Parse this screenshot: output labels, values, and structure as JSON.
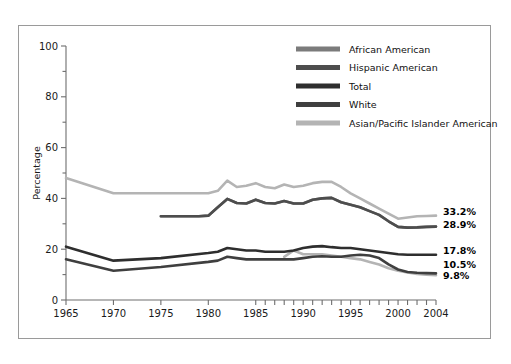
{
  "chart_data": {
    "type": "line",
    "title": "",
    "xlabel": "",
    "ylabel": "Percentage",
    "xlim": [
      1965,
      2004
    ],
    "ylim": [
      0,
      100
    ],
    "grid": false,
    "legend_position": "top-center-right",
    "y_ticks_major": [
      0,
      20,
      40,
      60,
      80,
      100
    ],
    "y_ticks_minor": [
      10,
      30,
      50,
      70,
      90
    ],
    "x_ticks_labeled": [
      1965,
      1970,
      1975,
      1980,
      1985,
      1990,
      1995,
      2000,
      2004
    ],
    "x_ticks_annual_from": 1985,
    "x_ticks_annual_to": 2004,
    "colors": {
      "african_american": "#7b7b7b",
      "hispanic_american": "#4d4d4d",
      "total": "#2e2e2e",
      "white": "#3f3f3f",
      "asian_pacific": "#b4b4b4"
    },
    "series": [
      {
        "name": "African American",
        "color_key": "african_american",
        "end_label": "33.2%",
        "x": [
          1975,
          1976,
          1977,
          1978,
          1979,
          1980,
          1981,
          1982,
          1983,
          1984,
          1985,
          1986,
          1987,
          1988,
          1989,
          1990,
          1991,
          1992,
          1993,
          1994,
          1995,
          1996,
          1997,
          1998,
          1999,
          2000,
          2001,
          2002,
          2003,
          2004
        ],
        "y": [
          33.0,
          33.0,
          33.0,
          33.0,
          33.0,
          33.2,
          36.5,
          39.8,
          38.2,
          38.0,
          39.5,
          38.2,
          38.0,
          39.0,
          38.0,
          38.0,
          39.5,
          40.0,
          40.2,
          38.5,
          37.5,
          36.5,
          35.0,
          33.5,
          31.0,
          28.8,
          28.5,
          28.6,
          28.8,
          28.9
        ]
      },
      {
        "name": "Hispanic American",
        "color_key": "hispanic_american",
        "end_label": "28.9%",
        "x": [
          1975,
          1976,
          1977,
          1978,
          1979,
          1980,
          1981,
          1982,
          1983,
          1984,
          1985,
          1986,
          1987,
          1988,
          1989,
          1990,
          1991,
          1992,
          1993,
          1994,
          1995,
          1996,
          1997,
          1998,
          1999,
          2000,
          2001,
          2002,
          2003,
          2004
        ],
        "y": [
          33.0,
          33.0,
          33.0,
          33.0,
          33.0,
          33.2,
          36.5,
          39.8,
          38.2,
          38.0,
          39.5,
          38.2,
          38.0,
          39.0,
          38.0,
          38.0,
          39.5,
          40.0,
          40.2,
          38.5,
          37.5,
          36.5,
          35.0,
          33.5,
          31.0,
          28.8,
          28.5,
          28.6,
          28.8,
          28.9
        ]
      },
      {
        "name": "Total",
        "color_key": "total",
        "end_label": "17.8%",
        "x": [
          1965,
          1970,
          1975,
          1980,
          1981,
          1982,
          1983,
          1984,
          1985,
          1986,
          1987,
          1988,
          1989,
          1990,
          1991,
          1992,
          1993,
          1994,
          1995,
          1996,
          1997,
          1998,
          1999,
          2000,
          2001,
          2002,
          2003,
          2004
        ],
        "y": [
          21.0,
          15.5,
          16.5,
          18.5,
          19.0,
          20.5,
          20.0,
          19.5,
          19.5,
          19.0,
          19.0,
          19.0,
          19.5,
          20.5,
          21.0,
          21.2,
          20.8,
          20.5,
          20.5,
          20.0,
          19.5,
          19.0,
          18.5,
          18.0,
          17.8,
          17.8,
          17.8,
          17.8
        ]
      },
      {
        "name": "White",
        "color_key": "white",
        "end_label": "10.5%",
        "x": [
          1965,
          1970,
          1975,
          1980,
          1981,
          1982,
          1983,
          1984,
          1985,
          1986,
          1987,
          1988,
          1989,
          1990,
          1991,
          1992,
          1993,
          1994,
          1995,
          1996,
          1997,
          1998,
          1999,
          2000,
          2001,
          2002,
          2003,
          2004
        ],
        "y": [
          16.0,
          11.5,
          13.0,
          15.0,
          15.5,
          17.0,
          16.5,
          16.0,
          16.0,
          16.0,
          16.0,
          16.0,
          16.0,
          16.5,
          17.0,
          17.2,
          17.0,
          17.0,
          17.5,
          17.8,
          17.5,
          16.5,
          14.0,
          12.0,
          11.0,
          10.7,
          10.6,
          10.5
        ]
      },
      {
        "name": "Asian/Pacific Islander American",
        "color_key": "asian_pacific",
        "end_label": "9.8%",
        "x": [
          1965,
          1970,
          1975,
          1980,
          1981,
          1982,
          1983,
          1984,
          1985,
          1986,
          1987,
          1988,
          1989,
          1990,
          1991,
          1992,
          1993,
          1994,
          1995,
          1996,
          1997,
          1998,
          1999,
          2000,
          2001,
          2002,
          2003,
          2004
        ],
        "y": [
          48.0,
          42.0,
          42.0,
          42.0,
          43.0,
          47.0,
          44.5,
          45.0,
          46.0,
          44.5,
          44.0,
          45.5,
          44.5,
          45.0,
          46.0,
          46.5,
          46.5,
          44.5,
          42.0,
          40.0,
          38.0,
          36.0,
          34.0,
          32.0,
          32.5,
          33.0,
          33.1,
          33.2
        ]
      },
      {
        "name": "Asian/Pacific Islander American Low",
        "color_key": "asian_pacific",
        "end_label": "",
        "x": [
          1988,
          1989,
          1990,
          1991,
          1992,
          1993,
          1994,
          1995,
          1996,
          1997,
          1998,
          1999,
          2000,
          2001,
          2002,
          2003,
          2004
        ],
        "y": [
          17.0,
          19.5,
          18.0,
          18.0,
          18.0,
          17.5,
          17.0,
          16.5,
          16.0,
          15.0,
          14.0,
          12.5,
          11.5,
          10.8,
          10.3,
          10.0,
          9.8
        ]
      }
    ]
  },
  "legend": {
    "items": [
      {
        "label": "African American",
        "color": "#7b7b7b"
      },
      {
        "label": "Hispanic American",
        "color": "#4d4d4d"
      },
      {
        "label": "Total",
        "color": "#2e2e2e"
      },
      {
        "label": "White",
        "color": "#3f3f3f"
      },
      {
        "label": "Asian/Pacific Islander American",
        "color": "#b4b4b4"
      }
    ]
  },
  "end_labels": [
    {
      "text": "33.2%",
      "y_value": 33.2
    },
    {
      "text": "28.9%",
      "y_value": 28.9
    },
    {
      "text": "17.8%",
      "y_value": 17.8
    },
    {
      "text": "10.5%",
      "y_value": 10.5
    },
    {
      "text": "9.8%",
      "y_value": 9.8
    }
  ]
}
